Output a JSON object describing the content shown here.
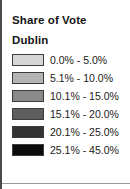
{
  "legend": {
    "title": "Share of Vote",
    "subtitle": "Dublin",
    "classes": [
      {
        "label": "0.0% - 5.0%",
        "color": "#d5d5d5",
        "min": 0.0,
        "max": 5.0
      },
      {
        "label": "5.1% - 10.0%",
        "color": "#b4b4b4",
        "min": 5.1,
        "max": 10.0
      },
      {
        "label": "10.1% - 15.0%",
        "color": "#8a8a8a",
        "min": 10.1,
        "max": 15.0
      },
      {
        "label": "15.1% - 20.0%",
        "color": "#5e5e5e",
        "min": 15.1,
        "max": 20.0
      },
      {
        "label": "20.1% - 25.0%",
        "color": "#333333",
        "min": 20.1,
        "max": 25.0
      },
      {
        "label": "25.1% - 45.0%",
        "color": "#0b0b0b",
        "min": 25.1,
        "max": 45.0
      }
    ]
  },
  "style": {
    "background": "#ffffff",
    "text_color": "#141414",
    "frame_color": "#4a4a4a",
    "swatch_border": "#3c3c3c"
  }
}
